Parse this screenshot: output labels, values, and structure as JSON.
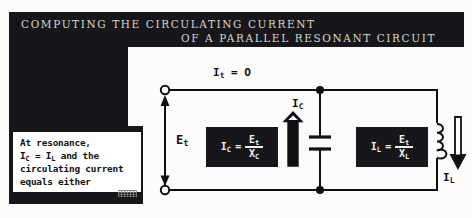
{
  "figure": {
    "title_line_1": "COMPUTING THE CIRCULATING CURRENT",
    "title_line_2": "OF A PARALLEL RESONANT CIRCUIT"
  },
  "note": {
    "line_1": "At resonance,",
    "line_2_a": "I",
    "line_2_sub_a": "C",
    "line_2_b": " = I",
    "line_2_sub_b": "L",
    "line_2_c": " and the",
    "line_3": "circulating current",
    "line_4": "equals either",
    "full_text": "At resonance, IC = IL and the circulating current equals either"
  },
  "circuit": {
    "total_current_label": "I",
    "total_current_sub": "t",
    "total_current_value": "= O",
    "source_voltage_label": "E",
    "source_voltage_sub": "t",
    "capacitor_current_label": "I",
    "capacitor_current_sub": "C",
    "inductor_current_label": "I",
    "inductor_current_sub": "L",
    "capacitor_formula": {
      "lhs": "I",
      "lhs_sub": "C",
      "equals": "=",
      "numerator": "E",
      "numerator_sub": "t",
      "denominator": "X",
      "denominator_sub": "C",
      "plain": "IC = Et / XC"
    },
    "inductor_formula": {
      "lhs": "I",
      "lhs_sub": "L",
      "equals": "=",
      "numerator": "E",
      "numerator_sub": "t",
      "denominator": "X",
      "denominator_sub": "L",
      "plain": "IL = Et / XL"
    }
  },
  "colors": {
    "ink": "#17161a",
    "paper": "#fdfcfa",
    "banner_text": "#d8d6d2"
  }
}
